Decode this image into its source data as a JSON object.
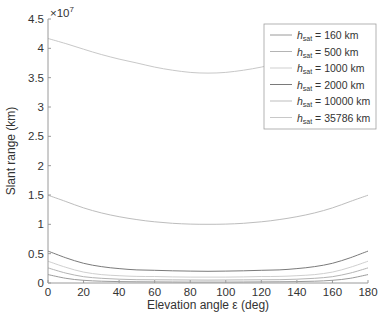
{
  "chart_data": {
    "type": "line",
    "title": "",
    "xlabel": "Elevation angle ε (deg)",
    "ylabel": "Slant range (km)",
    "y_exponent_label": "×10",
    "y_exponent_power": "7",
    "xlim": [
      0,
      180
    ],
    "ylim": [
      0,
      45000000
    ],
    "x_ticks": [
      0,
      20,
      40,
      60,
      80,
      100,
      120,
      140,
      160,
      180
    ],
    "x_tick_labels": [
      "0",
      "20",
      "40",
      "60",
      "80",
      "100",
      "120",
      "140",
      "160",
      "180"
    ],
    "y_ticks": [
      0,
      5000000,
      10000000,
      15000000,
      20000000,
      25000000,
      30000000,
      35000000,
      40000000,
      45000000
    ],
    "y_tick_labels": [
      "0",
      "0.5",
      "1",
      "1.5",
      "2",
      "2.5",
      "3",
      "3.5",
      "4",
      "4.5"
    ],
    "grid": false,
    "legend_position": "upper right",
    "x": [
      0,
      10,
      20,
      30,
      40,
      50,
      60,
      70,
      80,
      90,
      100,
      110,
      120,
      130,
      140,
      150,
      160,
      170,
      180
    ],
    "series": [
      {
        "name": "h_sat = 160 km",
        "label_main": "h",
        "label_sub": "sat",
        "label_rest": " = 160 km",
        "color": "#9a9a9a",
        "values": [
          1436000,
          800000,
          455000,
          313000,
          242000,
          203000,
          181000,
          168000,
          161000,
          160000,
          161000,
          168000,
          181000,
          203000,
          242000,
          313000,
          455000,
          800000,
          1436000
        ]
      },
      {
        "name": "h_sat = 500 km",
        "label_main": "h",
        "label_sub": "sat",
        "label_rest": " = 500 km",
        "color": "#b4b4b4",
        "values": [
          2574000,
          1695000,
          1080000,
          801000,
          650000,
          562000,
          546000,
          520000,
          505000,
          500000,
          505000,
          520000,
          546000,
          562000,
          650000,
          801000,
          1080000,
          1695000,
          2574000
        ]
      },
      {
        "name": "h_sat = 1000 km",
        "label_main": "h",
        "label_sub": "sat",
        "label_rest": " = 1000 km",
        "color": "#cfcfcf",
        "values": [
          3709000,
          2675000,
          1863000,
          1440000,
          1240000,
          1120000,
          1100000,
          1040000,
          1010000,
          1000000,
          1010000,
          1040000,
          1100000,
          1120000,
          1240000,
          1440000,
          1863000,
          2675000,
          3709000
        ]
      },
      {
        "name": "h_sat = 2000 km",
        "label_main": "h",
        "label_sub": "sat",
        "label_rest": " = 2000 km",
        "color": "#7a7a7a",
        "values": [
          5435000,
          4300000,
          3360000,
          2800000,
          2450000,
          2240000,
          2170000,
          2080000,
          2020000,
          2000000,
          2020000,
          2080000,
          2170000,
          2240000,
          2450000,
          2800000,
          3360000,
          4300000,
          5435000
        ]
      },
      {
        "name": "h_sat = 10000 km",
        "label_main": "h",
        "label_sub": "sat",
        "label_rest": " = 10000 km",
        "color": "#bdbdbd",
        "values": [
          14960000,
          13900000,
          12800000,
          11950000,
          11300000,
          10800000,
          10430000,
          10180000,
          10040000,
          10000000,
          10040000,
          10180000,
          10430000,
          10800000,
          11300000,
          11950000,
          12800000,
          13900000,
          14960000
        ]
      },
      {
        "name": "h_sat = 35786 km",
        "label_main": "h",
        "label_sub": "sat",
        "label_rest": " = 35786 km",
        "color": "#c8c8c8",
        "values": [
          41680000,
          40800000,
          39850000,
          38950000,
          38170000,
          37500000,
          36800000,
          36280000,
          35900000,
          35786000,
          35900000,
          36280000,
          36800000,
          37500000,
          38170000,
          38950000,
          39850000,
          40800000,
          41680000
        ]
      }
    ]
  }
}
